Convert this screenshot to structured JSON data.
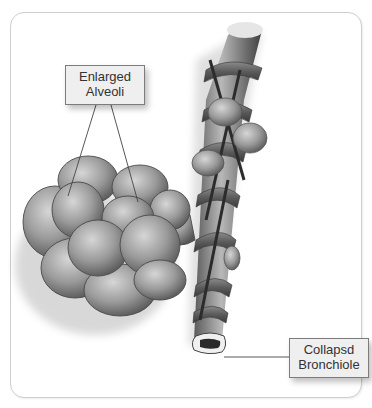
{
  "figure": {
    "labels": [
      {
        "id": "alveoli",
        "lines": [
          "Enlarged",
          "Alveoli"
        ]
      },
      {
        "id": "bronchiole",
        "lines": [
          "Collapsd",
          "Bronchiole"
        ]
      }
    ]
  },
  "colors": {
    "frame_border": "#cfcfcf",
    "label_fill": "#efefef",
    "label_border": "#7c7c7c",
    "tissue_light": "#c9c9c9",
    "tissue_mid": "#8e8e8e",
    "tissue_dark": "#4a4a4a"
  }
}
